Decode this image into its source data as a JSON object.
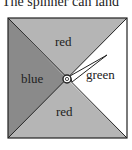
{
  "caption": "The spinner can land",
  "spinner": {
    "regions": [
      {
        "position": "top",
        "label": "red",
        "color": "#b5b5b5"
      },
      {
        "position": "left",
        "label": "blue",
        "color": "#8a8a8a"
      },
      {
        "position": "right",
        "label": "green",
        "color": "#ffffff"
      },
      {
        "position": "bottom",
        "label": "red",
        "color": "#b5b5b5"
      }
    ]
  }
}
